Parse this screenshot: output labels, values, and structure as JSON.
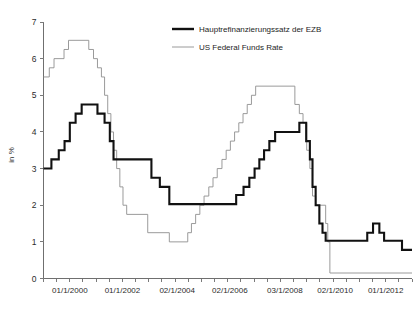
{
  "chart_data": {
    "type": "line",
    "title": "",
    "subtitle": "",
    "xlabel": "",
    "ylabel": "in %",
    "ylim": [
      0,
      7
    ],
    "yticks": [
      0,
      1,
      2,
      3,
      4,
      5,
      6,
      7
    ],
    "ytick_labels": [
      "0",
      "1",
      "2",
      "3",
      "4",
      "5",
      "6",
      "7"
    ],
    "xlim": [
      "1999-01",
      "2013-01"
    ],
    "xtick_labels": [
      "01/1/2000",
      "01/1/2002",
      "02/1/2004",
      "02/1/2006",
      "03/1/2008",
      "02/1/2010",
      "01/1/2012"
    ],
    "xtick_positions": [
      1.0,
      3.0,
      5.08,
      7.08,
      9.17,
      11.08,
      13.0
    ],
    "grid": false,
    "legend_position": "top-right",
    "line_style": "step",
    "series": [
      {
        "name": "Hauptrefinanzierungssatz der EZB",
        "color": "#111111",
        "style": "thick",
        "points": [
          [
            0.0,
            3.0
          ],
          [
            0.3,
            3.0
          ],
          [
            0.3,
            3.25
          ],
          [
            0.58,
            3.25
          ],
          [
            0.58,
            3.5
          ],
          [
            0.8,
            3.5
          ],
          [
            0.8,
            3.75
          ],
          [
            1.0,
            3.75
          ],
          [
            1.0,
            4.25
          ],
          [
            1.22,
            4.25
          ],
          [
            1.22,
            4.5
          ],
          [
            1.45,
            4.5
          ],
          [
            1.45,
            4.75
          ],
          [
            2.05,
            4.75
          ],
          [
            2.05,
            4.5
          ],
          [
            2.32,
            4.5
          ],
          [
            2.32,
            4.25
          ],
          [
            2.52,
            4.25
          ],
          [
            2.52,
            3.75
          ],
          [
            2.66,
            3.75
          ],
          [
            2.66,
            3.25
          ],
          [
            3.55,
            3.25
          ],
          [
            3.55,
            3.25
          ],
          [
            4.1,
            3.25
          ],
          [
            4.1,
            2.75
          ],
          [
            4.42,
            2.75
          ],
          [
            4.42,
            2.5
          ],
          [
            4.78,
            2.5
          ],
          [
            4.78,
            2.03
          ],
          [
            7.0,
            2.03
          ],
          [
            7.0,
            2.03
          ],
          [
            7.32,
            2.03
          ],
          [
            7.32,
            2.28
          ],
          [
            7.6,
            2.28
          ],
          [
            7.6,
            2.5
          ],
          [
            7.82,
            2.5
          ],
          [
            7.82,
            2.75
          ],
          [
            8.02,
            2.75
          ],
          [
            8.02,
            3.0
          ],
          [
            8.2,
            3.0
          ],
          [
            8.2,
            3.25
          ],
          [
            8.38,
            3.25
          ],
          [
            8.38,
            3.5
          ],
          [
            8.58,
            3.5
          ],
          [
            8.58,
            3.75
          ],
          [
            8.8,
            3.75
          ],
          [
            8.8,
            4.0
          ],
          [
            9.72,
            4.0
          ],
          [
            9.72,
            4.25
          ],
          [
            9.98,
            4.25
          ],
          [
            9.98,
            3.75
          ],
          [
            10.12,
            3.75
          ],
          [
            10.12,
            3.25
          ],
          [
            10.22,
            3.25
          ],
          [
            10.22,
            2.5
          ],
          [
            10.34,
            2.5
          ],
          [
            10.34,
            2.0
          ],
          [
            10.48,
            2.0
          ],
          [
            10.48,
            1.5
          ],
          [
            10.6,
            1.5
          ],
          [
            10.6,
            1.25
          ],
          [
            10.72,
            1.25
          ],
          [
            10.72,
            1.03
          ],
          [
            12.3,
            1.03
          ],
          [
            12.3,
            1.25
          ],
          [
            12.52,
            1.25
          ],
          [
            12.52,
            1.5
          ],
          [
            12.76,
            1.5
          ],
          [
            12.76,
            1.25
          ],
          [
            12.94,
            1.25
          ],
          [
            12.94,
            1.03
          ],
          [
            13.62,
            1.03
          ],
          [
            13.62,
            0.78
          ],
          [
            14.0,
            0.78
          ]
        ]
      },
      {
        "name": "US Federal Funds Rate",
        "color": "#8e8e8e",
        "style": "thin",
        "points": [
          [
            0.0,
            5.5
          ],
          [
            0.22,
            5.5
          ],
          [
            0.22,
            5.75
          ],
          [
            0.4,
            5.75
          ],
          [
            0.4,
            6.0
          ],
          [
            0.78,
            6.0
          ],
          [
            0.78,
            6.25
          ],
          [
            0.95,
            6.25
          ],
          [
            0.95,
            6.5
          ],
          [
            1.72,
            6.5
          ],
          [
            1.72,
            6.25
          ],
          [
            1.9,
            6.25
          ],
          [
            1.9,
            6.0
          ],
          [
            2.05,
            6.0
          ],
          [
            2.05,
            5.75
          ],
          [
            2.2,
            5.75
          ],
          [
            2.2,
            5.5
          ],
          [
            2.32,
            5.5
          ],
          [
            2.32,
            5.0
          ],
          [
            2.44,
            5.0
          ],
          [
            2.44,
            4.5
          ],
          [
            2.56,
            4.5
          ],
          [
            2.56,
            4.0
          ],
          [
            2.66,
            4.0
          ],
          [
            2.66,
            3.5
          ],
          [
            2.78,
            3.5
          ],
          [
            2.78,
            3.0
          ],
          [
            2.9,
            3.0
          ],
          [
            2.9,
            2.5
          ],
          [
            3.02,
            2.5
          ],
          [
            3.02,
            2.0
          ],
          [
            3.16,
            2.0
          ],
          [
            3.16,
            1.75
          ],
          [
            3.96,
            1.75
          ],
          [
            3.96,
            1.25
          ],
          [
            4.78,
            1.25
          ],
          [
            4.78,
            1.0
          ],
          [
            5.48,
            1.0
          ],
          [
            5.48,
            1.25
          ],
          [
            5.62,
            1.25
          ],
          [
            5.62,
            1.5
          ],
          [
            5.78,
            1.5
          ],
          [
            5.78,
            1.75
          ],
          [
            5.94,
            1.75
          ],
          [
            5.94,
            2.0
          ],
          [
            6.1,
            2.0
          ],
          [
            6.1,
            2.25
          ],
          [
            6.28,
            2.25
          ],
          [
            6.28,
            2.5
          ],
          [
            6.44,
            2.5
          ],
          [
            6.44,
            2.75
          ],
          [
            6.6,
            2.75
          ],
          [
            6.6,
            3.0
          ],
          [
            6.78,
            3.0
          ],
          [
            6.78,
            3.25
          ],
          [
            6.94,
            3.25
          ],
          [
            6.94,
            3.5
          ],
          [
            7.1,
            3.5
          ],
          [
            7.1,
            3.75
          ],
          [
            7.26,
            3.75
          ],
          [
            7.26,
            4.0
          ],
          [
            7.42,
            4.0
          ],
          [
            7.42,
            4.25
          ],
          [
            7.58,
            4.25
          ],
          [
            7.58,
            4.5
          ],
          [
            7.74,
            4.5
          ],
          [
            7.74,
            4.75
          ],
          [
            7.9,
            4.75
          ],
          [
            7.9,
            5.0
          ],
          [
            8.06,
            5.0
          ],
          [
            8.06,
            5.25
          ],
          [
            9.55,
            5.25
          ],
          [
            9.55,
            4.75
          ],
          [
            9.72,
            4.75
          ],
          [
            9.72,
            4.5
          ],
          [
            9.86,
            4.5
          ],
          [
            9.86,
            4.25
          ],
          [
            10.0,
            4.25
          ],
          [
            10.0,
            3.5
          ],
          [
            10.12,
            3.5
          ],
          [
            10.12,
            3.0
          ],
          [
            10.22,
            3.0
          ],
          [
            10.22,
            2.25
          ],
          [
            10.34,
            2.25
          ],
          [
            10.34,
            2.0
          ],
          [
            10.72,
            2.0
          ],
          [
            10.72,
            1.5
          ],
          [
            10.8,
            1.5
          ],
          [
            10.8,
            1.0
          ],
          [
            10.88,
            1.0
          ],
          [
            10.88,
            0.15
          ],
          [
            14.0,
            0.15
          ]
        ]
      }
    ]
  },
  "legend": {
    "entries": [
      {
        "label": "Hauptrefinanzierungssatz der EZB",
        "swatch": "thick-black-line"
      },
      {
        "label": "US Federal Funds Rate",
        "swatch": "thin-gray-line"
      }
    ]
  },
  "axes": {
    "y_label": "in %",
    "y_tick_labels": [
      "7",
      "6",
      "5",
      "4",
      "3",
      "2",
      "1",
      "0"
    ],
    "x_tick_labels": [
      "01/1/2000",
      "01/1/2002",
      "02/1/2004",
      "02/1/2006",
      "03/1/2008",
      "02/1/2010",
      "01/1/2012"
    ]
  },
  "colors": {
    "ecb_line": "#111111",
    "fed_line": "#8e8e8e",
    "axis": "#6f6f6f",
    "background": "#ffffff"
  }
}
